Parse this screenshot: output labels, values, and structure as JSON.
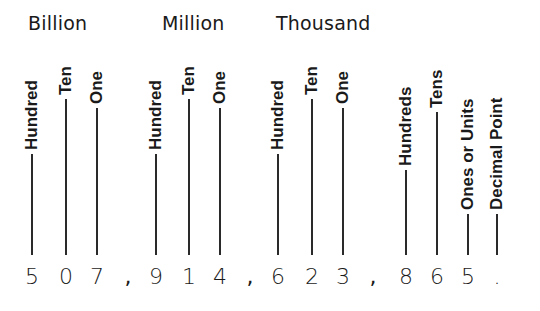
{
  "groups": [
    {
      "title": "Billion",
      "x": 28
    },
    {
      "title": "Million",
      "x": 162
    },
    {
      "title": "Thousand",
      "x": 276
    }
  ],
  "columns": [
    {
      "label": "Hundred",
      "x": 32,
      "label_bottom": 150,
      "digit": "5"
    },
    {
      "label": "Ten",
      "x": 66,
      "label_bottom": 95,
      "digit": "0"
    },
    {
      "label": "One",
      "x": 97,
      "label_bottom": 104,
      "digit": "7"
    },
    {
      "label": "Hundred",
      "x": 156,
      "label_bottom": 150,
      "digit": "9"
    },
    {
      "label": "Ten",
      "x": 189,
      "label_bottom": 95,
      "digit": "1"
    },
    {
      "label": "One",
      "x": 220,
      "label_bottom": 104,
      "digit": "4"
    },
    {
      "label": "Hundred",
      "x": 278,
      "label_bottom": 150,
      "digit": "6"
    },
    {
      "label": "Ten",
      "x": 312,
      "label_bottom": 95,
      "digit": "2"
    },
    {
      "label": "One",
      "x": 343,
      "label_bottom": 104,
      "digit": "3"
    },
    {
      "label": "Hundreds",
      "x": 406,
      "label_bottom": 166,
      "digit": "8"
    },
    {
      "label": "Tens",
      "x": 437,
      "label_bottom": 108,
      "digit": "6"
    },
    {
      "label": "Ones or Units",
      "x": 468,
      "label_bottom": 210,
      "digit": "5"
    },
    {
      "label": "Decimal Point",
      "x": 497,
      "label_bottom": 210,
      "digit": "."
    }
  ],
  "separators": [
    {
      "char": ",",
      "x": 128
    },
    {
      "char": ",",
      "x": 250
    },
    {
      "char": ",",
      "x": 373
    }
  ],
  "number": "507,914,623,865.",
  "line_bottom": 255
}
